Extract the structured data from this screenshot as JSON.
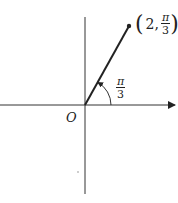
{
  "diagram": {
    "type": "polar-coordinate-point",
    "origin_label": "O",
    "point": {
      "r": "2",
      "theta_numerator": "π",
      "theta_denominator": "3",
      "label_prefix": "2,"
    },
    "angle": {
      "numerator": "π",
      "denominator": "3"
    },
    "colors": {
      "stroke": "#222222",
      "background": "#ffffff"
    }
  }
}
